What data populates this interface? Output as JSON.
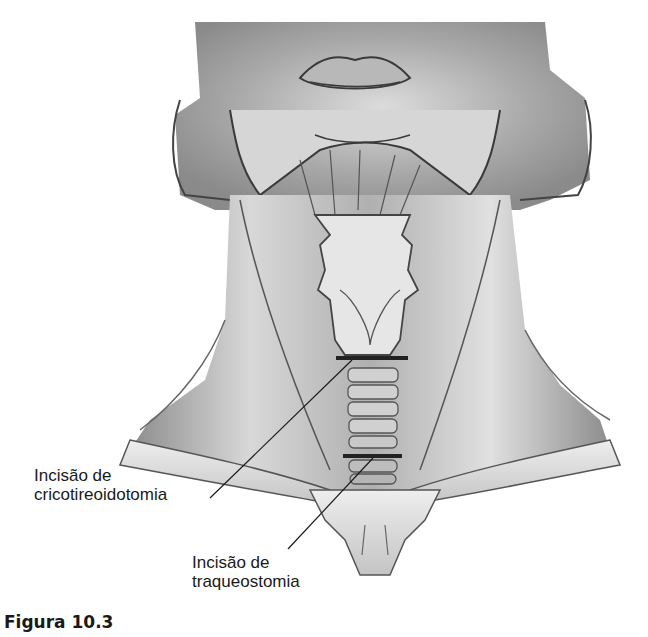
{
  "figure": {
    "caption": "Figura 10.3",
    "labels": [
      {
        "id": "cricothyroidotomy",
        "line1": "Incisão de",
        "line2": "cricotireoidotomia"
      },
      {
        "id": "tracheostomy",
        "line1": "Incisão de",
        "line2": "traqueostomia"
      }
    ]
  },
  "colors": {
    "background": "#ffffff",
    "ink": "#1a1a1a",
    "skin_shade": "#9a9a9a",
    "incision": "#2a2a2a"
  }
}
